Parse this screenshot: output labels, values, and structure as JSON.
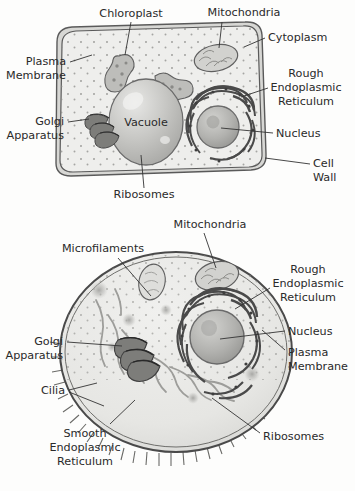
{
  "figure": {
    "background_color": "#fdfdfc",
    "label_color": "#2a2a2a",
    "leader_color": "#333333"
  },
  "plant_cell": {
    "name": "Plant cell",
    "center_label": "Vacuole",
    "labels": [
      {
        "id": "chloroplast",
        "text": "Chloroplast",
        "align": "middle",
        "x": 131,
        "y": 17
      },
      {
        "id": "mitochondria",
        "text": "Mitochondria",
        "align": "middle",
        "x": 244,
        "y": 16
      },
      {
        "id": "cytoplasm",
        "text": "Cytoplasm",
        "align": "start",
        "x": 268,
        "y": 41
      },
      {
        "id": "plasma-membrane",
        "text": "Plasma\nMembrane",
        "align": "end",
        "x": 66,
        "y": 65
      },
      {
        "id": "rough-er",
        "text": "Rough\nEndoplasmic\nReticulum",
        "align": "middle",
        "x": 306,
        "y": 77
      },
      {
        "id": "golgi-apparatus",
        "text": "Golgi\nApparatus",
        "align": "end",
        "x": 64,
        "y": 125
      },
      {
        "id": "nucleus",
        "text": "Nucleus",
        "align": "start",
        "x": 276,
        "y": 133
      },
      {
        "id": "cell-wall",
        "text": "Cell\nWall",
        "align": "start",
        "x": 313,
        "y": 163
      },
      {
        "id": "ribosomes",
        "text": "Ribosomes",
        "align": "middle",
        "x": 144,
        "y": 196
      }
    ]
  },
  "animal_cell": {
    "name": "Animal cell",
    "labels": [
      {
        "id": "mitochondria",
        "text": "Mitochondria",
        "align": "middle",
        "x": 210,
        "y": 228
      },
      {
        "id": "microfilaments",
        "text": "Microfilaments",
        "align": "middle",
        "x": 103,
        "y": 252
      },
      {
        "id": "rough-er",
        "text": "Rough\nEndoplasmic\nReticulum",
        "align": "middle",
        "x": 308,
        "y": 273
      },
      {
        "id": "nucleus",
        "text": "Nucleus",
        "align": "start",
        "x": 288,
        "y": 330
      },
      {
        "id": "plasma-membrane",
        "text": "Plasma\nMembrane",
        "align": "start",
        "x": 288,
        "y": 352
      },
      {
        "id": "golgi-apparatus",
        "text": "Golgi\nApparatus",
        "align": "end",
        "x": 63,
        "y": 345
      },
      {
        "id": "cilia",
        "text": "Cilia",
        "align": "end",
        "x": 65,
        "y": 393
      },
      {
        "id": "smooth-er",
        "text": "Smooth\nEndoplasmic\nReticulum",
        "align": "middle",
        "x": 85,
        "y": 437
      },
      {
        "id": "ribosomes",
        "text": "Ribosomes",
        "align": "start",
        "x": 263,
        "y": 436
      }
    ]
  },
  "colors": {
    "cytoplasm_fill": "#eeeeec",
    "wall_fill": "#d9d9d6",
    "outline": "#555555",
    "organelle_dark": "#6e6e6e",
    "organelle_mid": "#a8a8a6",
    "vacuole_light": "#cfcfcd",
    "cilia_band": "#bdbdba"
  }
}
